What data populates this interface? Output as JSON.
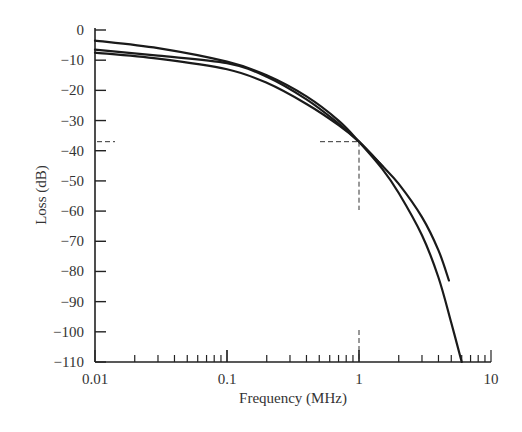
{
  "chart_data": {
    "type": "line",
    "title": "",
    "xlabel": "Frequency (MHz)",
    "ylabel": "Loss (dB)",
    "xscale": "log",
    "xlim": [
      0.01,
      10
    ],
    "ylim": [
      -110,
      0
    ],
    "x_ticks": [
      "0.01",
      "0.1",
      "1",
      "10"
    ],
    "y_ticks": [
      "0",
      "-10",
      "-20",
      "-30",
      "-40",
      "-50",
      "-60",
      "-70",
      "-80",
      "-90",
      "-100",
      "-110"
    ],
    "grid": false,
    "legend": null,
    "annotations": [
      {
        "type": "dashed-reference",
        "x": 1,
        "y": -37,
        "description": "dashed lines marking approx -37 dB at 1 MHz"
      }
    ],
    "series": [
      {
        "name": "curve-1",
        "x": [
          0.01,
          0.03,
          0.1,
          0.2,
          0.4,
          0.7,
          1,
          1.5,
          2,
          3,
          4,
          5,
          6
        ],
        "y": [
          -3.5,
          -6,
          -10.5,
          -15,
          -22,
          -30,
          -37,
          -46,
          -54,
          -68,
          -82,
          -97,
          -110
        ]
      },
      {
        "name": "curve-2",
        "x": [
          0.01,
          0.03,
          0.1,
          0.2,
          0.4,
          0.7,
          1,
          1.5,
          2,
          3,
          4,
          4.8
        ],
        "y": [
          -6.5,
          -8.5,
          -11,
          -15.5,
          -23,
          -31,
          -37,
          -45,
          -51,
          -62,
          -73,
          -83
        ]
      },
      {
        "name": "curve-3",
        "x": [
          0.01,
          0.03,
          0.1,
          0.2,
          0.4,
          0.7,
          1,
          1.5
        ],
        "y": [
          -7.5,
          -9.5,
          -13,
          -17.5,
          -24.5,
          -31.5,
          -37,
          -45
        ]
      }
    ]
  }
}
